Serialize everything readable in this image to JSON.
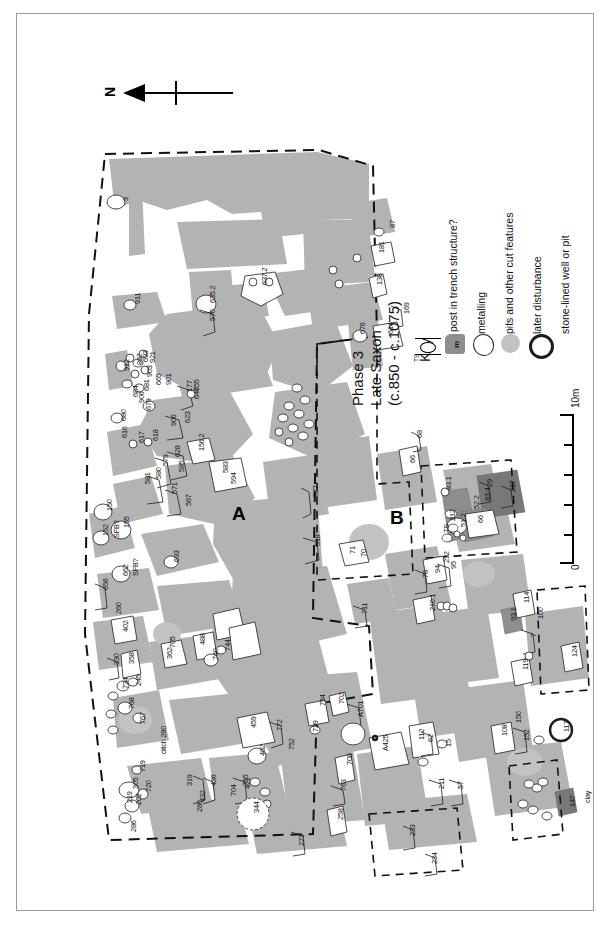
{
  "figure": {
    "title_lines": [
      "Phase 3",
      "Late Saxon",
      "(c.850 - c.1075)"
    ],
    "north_label": "N",
    "structure_labels": [
      "A",
      "B"
    ],
    "scale": {
      "min": "0",
      "max": "10m"
    },
    "colors": {
      "excavated_deposit": "#b3b3b3",
      "metalling": "#8e8e8e",
      "later_disturbance": "#c9c9c9",
      "outline": "#222222",
      "frame": "#9a9a9a",
      "background": "#ffffff"
    }
  },
  "key": {
    "title": "Key",
    "items": [
      {
        "symbol": "post-in-trench-symbol",
        "label": "post in trench structure?",
        "sub_label": "TS"
      },
      {
        "symbol": "metalling-symbol",
        "label": "metalling",
        "sub_label": "m"
      },
      {
        "symbol": "pit-symbol",
        "label": "pits and other cut features",
        "sub_label": ""
      },
      {
        "symbol": "later-disturbance-symbol",
        "label": "later disturbance",
        "sub_label": ""
      },
      {
        "symbol": "stone-lined-well-symbol",
        "label": "stone-lined well or pit",
        "sub_label": ""
      }
    ]
  },
  "annotations": {
    "material_labels": [
      "clay",
      "ditch 280"
    ],
    "structure_codes": [
      "TS",
      "m",
      "SFB?"
    ]
  },
  "features": [
    {
      "id": "3",
      "x": 104,
      "y": 187
    },
    {
      "id": "911",
      "x": 116,
      "y": 290
    },
    {
      "id": "693",
      "x": 124,
      "y": 348
    },
    {
      "id": "912",
      "x": 105,
      "y": 357
    },
    {
      "id": "862",
      "x": 118,
      "y": 351
    },
    {
      "id": "921",
      "x": 131,
      "y": 349
    },
    {
      "id": "903",
      "x": 128,
      "y": 363
    },
    {
      "id": "680",
      "x": 102,
      "y": 407
    },
    {
      "id": "684",
      "x": 114,
      "y": 383
    },
    {
      "id": "681",
      "x": 125,
      "y": 377
    },
    {
      "id": "906",
      "x": 120,
      "y": 389
    },
    {
      "id": "679",
      "x": 127,
      "y": 396
    },
    {
      "id": "665",
      "x": 137,
      "y": 371
    },
    {
      "id": "901",
      "x": 147,
      "y": 371
    },
    {
      "id": "177",
      "x": 168,
      "y": 378
    },
    {
      "id": "647",
      "x": 175,
      "y": 385
    },
    {
      "id": "623",
      "x": 166,
      "y": 409
    },
    {
      "id": "906b",
      "x": 152,
      "y": 412
    },
    {
      "id": "655",
      "x": 175,
      "y": 377
    },
    {
      "id": "617",
      "x": 120,
      "y": 429
    },
    {
      "id": "618",
      "x": 134,
      "y": 427
    },
    {
      "id": "616",
      "x": 103,
      "y": 424
    },
    {
      "id": "579",
      "x": 144,
      "y": 452
    },
    {
      "id": "580",
      "x": 137,
      "y": 465
    },
    {
      "id": "581",
      "x": 126,
      "y": 470
    },
    {
      "id": "585",
      "x": 160,
      "y": 458
    },
    {
      "id": "628",
      "x": 156,
      "y": 443
    },
    {
      "id": "571",
      "x": 153,
      "y": 480
    },
    {
      "id": "567",
      "x": 167,
      "y": 492
    },
    {
      "id": "156.2",
      "x": 180,
      "y": 437
    },
    {
      "id": "583",
      "x": 204,
      "y": 459
    },
    {
      "id": "594",
      "x": 212,
      "y": 470
    },
    {
      "id": "570",
      "x": 191,
      "y": 307
    },
    {
      "id": "635.2",
      "x": 191,
      "y": 289
    },
    {
      "id": "637.2",
      "x": 243,
      "y": 271
    },
    {
      "id": "87",
      "x": 371,
      "y": 214
    },
    {
      "id": "181",
      "x": 360,
      "y": 239
    },
    {
      "id": "138",
      "x": 358,
      "y": 271
    },
    {
      "id": "169",
      "x": 385,
      "y": 300
    },
    {
      "id": "614",
      "x": 369,
      "y": 320
    },
    {
      "id": "676",
      "x": 341,
      "y": 320
    },
    {
      "id": "150",
      "x": 88,
      "y": 497
    },
    {
      "id": "152",
      "x": 84,
      "y": 522
    },
    {
      "id": "SFB?",
      "x": 95,
      "y": 524
    },
    {
      "id": "155",
      "x": 105,
      "y": 514
    },
    {
      "id": "662",
      "x": 104,
      "y": 562
    },
    {
      "id": "SFB?2",
      "x": 114,
      "y": 562
    },
    {
      "id": "656",
      "x": 84,
      "y": 576
    },
    {
      "id": "693b",
      "x": 155,
      "y": 548
    },
    {
      "id": "260",
      "x": 97,
      "y": 600
    },
    {
      "id": "402",
      "x": 104,
      "y": 618
    },
    {
      "id": "330",
      "x": 95,
      "y": 651
    },
    {
      "id": "358",
      "x": 110,
      "y": 650
    },
    {
      "id": "734",
      "x": 104,
      "y": 675
    },
    {
      "id": "245",
      "x": 117,
      "y": 672
    },
    {
      "id": "768",
      "x": 110,
      "y": 695
    },
    {
      "id": "767",
      "x": 121,
      "y": 710
    },
    {
      "id": "719",
      "x": 121,
      "y": 758
    },
    {
      "id": "305",
      "x": 114,
      "y": 775
    },
    {
      "id": "720",
      "x": 127,
      "y": 778
    },
    {
      "id": "219",
      "x": 108,
      "y": 789
    },
    {
      "id": "202",
      "x": 117,
      "y": 791
    },
    {
      "id": "286",
      "x": 112,
      "y": 818
    },
    {
      "id": "705",
      "x": 151,
      "y": 634
    },
    {
      "id": "488",
      "x": 181,
      "y": 631
    },
    {
      "id": "362",
      "x": 148,
      "y": 645
    },
    {
      "id": "744",
      "x": 206,
      "y": 637
    },
    {
      "id": "740",
      "x": 194,
      "y": 646
    },
    {
      "id": "459",
      "x": 232,
      "y": 714
    },
    {
      "id": "462",
      "x": 241,
      "y": 742
    },
    {
      "id": "772",
      "x": 258,
      "y": 717
    },
    {
      "id": "755",
      "x": 224,
      "y": 772
    },
    {
      "id": "319",
      "x": 168,
      "y": 772
    },
    {
      "id": "432",
      "x": 181,
      "y": 788
    },
    {
      "id": "436",
      "x": 192,
      "y": 772
    },
    {
      "id": "280",
      "x": 178,
      "y": 798
    },
    {
      "id": "ditch 280",
      "x": 142,
      "y": 740
    },
    {
      "id": "704",
      "x": 212,
      "y": 782
    },
    {
      "id": "421",
      "x": 226,
      "y": 775
    },
    {
      "id": "344",
      "x": 235,
      "y": 799
    },
    {
      "id": "273",
      "x": 280,
      "y": 832
    },
    {
      "id": "258",
      "x": 319,
      "y": 806
    },
    {
      "id": "763",
      "x": 322,
      "y": 777
    },
    {
      "id": "708",
      "x": 328,
      "y": 751
    },
    {
      "id": "752",
      "x": 270,
      "y": 736
    },
    {
      "id": "729",
      "x": 294,
      "y": 718
    },
    {
      "id": "754",
      "x": 301,
      "y": 692
    },
    {
      "id": "702",
      "x": 320,
      "y": 690
    },
    {
      "id": "A701",
      "x": 339,
      "y": 703
    },
    {
      "id": "A425",
      "x": 364,
      "y": 737
    },
    {
      "id": "112",
      "x": 400,
      "y": 726
    },
    {
      "id": "62",
      "x": 409,
      "y": 728
    },
    {
      "id": "15",
      "x": 427,
      "y": 733
    },
    {
      "id": "211",
      "x": 420,
      "y": 775
    },
    {
      "id": "57",
      "x": 439,
      "y": 775
    },
    {
      "id": "233",
      "x": 391,
      "y": 822
    },
    {
      "id": "234",
      "x": 413,
      "y": 850
    },
    {
      "id": "518",
      "x": 296,
      "y": 532
    },
    {
      "id": "827",
      "x": 294,
      "y": 483
    },
    {
      "id": "711",
      "x": 343,
      "y": 600
    },
    {
      "id": "71",
      "x": 331,
      "y": 540
    },
    {
      "id": "70",
      "x": 342,
      "y": 543
    },
    {
      "id": "66",
      "x": 391,
      "y": 449
    },
    {
      "id": "68",
      "x": 398,
      "y": 424
    },
    {
      "id": "83.1",
      "x": 427,
      "y": 476
    },
    {
      "id": "83.4",
      "x": 466,
      "y": 487
    },
    {
      "id": "217",
      "x": 491,
      "y": 478
    },
    {
      "id": "29",
      "x": 468,
      "y": 473
    },
    {
      "id": "52.2",
      "x": 455,
      "y": 495
    },
    {
      "id": "51.2",
      "x": 442,
      "y": 513
    },
    {
      "id": "66b",
      "x": 459,
      "y": 509
    },
    {
      "id": "212",
      "x": 431,
      "y": 507
    },
    {
      "id": "TS",
      "x": 425,
      "y": 519
    },
    {
      "id": "232",
      "x": 425,
      "y": 549
    },
    {
      "id": "94",
      "x": 416,
      "y": 559
    },
    {
      "id": "95",
      "x": 432,
      "y": 555
    },
    {
      "id": "78",
      "x": 404,
      "y": 564
    },
    {
      "id": "210.1",
      "x": 411,
      "y": 597
    },
    {
      "id": "93.1",
      "x": 492,
      "y": 607
    },
    {
      "id": "114",
      "x": 505,
      "y": 589
    },
    {
      "id": "100",
      "x": 519,
      "y": 605
    },
    {
      "id": "7",
      "x": 512,
      "y": 623
    },
    {
      "id": "119",
      "x": 504,
      "y": 656
    },
    {
      "id": "124",
      "x": 553,
      "y": 643
    },
    {
      "id": "108",
      "x": 483,
      "y": 722
    },
    {
      "id": "150b",
      "x": 497,
      "y": 709
    },
    {
      "id": "152b",
      "x": 505,
      "y": 727
    },
    {
      "id": "117",
      "x": 545,
      "y": 718
    },
    {
      "id": "147",
      "x": 551,
      "y": 793
    },
    {
      "id": "clay",
      "x": 566,
      "y": 789
    }
  ]
}
